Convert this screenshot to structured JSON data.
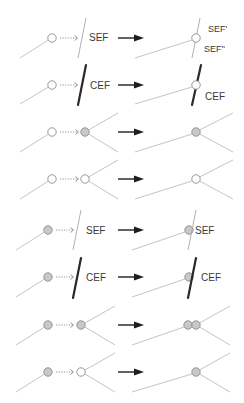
{
  "colors": {
    "node_open": "#ffffff",
    "node_filled": "#c8c8c8",
    "node_stroke": "#8c8c8c",
    "edge": "#c4c4c4",
    "sef_line": "#a8a8a8",
    "cef_line": "#2a2a2a",
    "arrow": "#1e1e1e",
    "text": "#3a3a3a"
  },
  "labels": {
    "sef": "SEF",
    "cef": "CEF",
    "sef_prime": "SEF'",
    "sef_double_prime": "SEF''"
  },
  "rows": [
    {
      "id": 1,
      "before": {
        "source": "open",
        "target": "SEF line (thin)"
      },
      "after": {
        "node": "open",
        "on": "SEF split",
        "labels": [
          "SEF'",
          "SEF''"
        ]
      }
    },
    {
      "id": 2,
      "before": {
        "source": "open",
        "target": "CEF line (thick)"
      },
      "after": {
        "node": "open",
        "on": "CEF",
        "labels": [
          "CEF"
        ]
      }
    },
    {
      "id": 3,
      "before": {
        "source": "open",
        "target": "filled node"
      },
      "after": {
        "node": "filled"
      }
    },
    {
      "id": 4,
      "before": {
        "source": "open",
        "target": "open node"
      },
      "after": {
        "node": "open"
      }
    },
    {
      "id": 5,
      "before": {
        "source": "filled",
        "target": "SEF line (thin)"
      },
      "after": {
        "node": "filled",
        "on": "SEF",
        "labels": [
          "SEF"
        ]
      }
    },
    {
      "id": 6,
      "before": {
        "source": "filled",
        "target": "CEF line (thick)"
      },
      "after": {
        "node": "filled",
        "on": "CEF",
        "labels": [
          "CEF"
        ]
      }
    },
    {
      "id": 7,
      "before": {
        "source": "filled",
        "target": "filled node"
      },
      "after": {
        "node": "two filled nodes (merged pair)"
      }
    },
    {
      "id": 8,
      "before": {
        "source": "filled",
        "target": "open node"
      },
      "after": {
        "node": "filled"
      }
    }
  ]
}
